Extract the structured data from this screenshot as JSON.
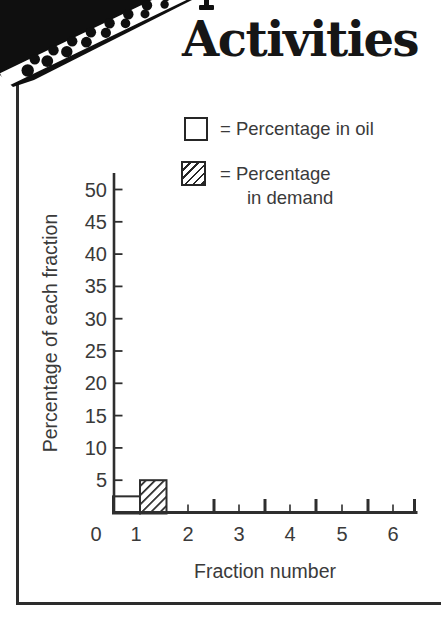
{
  "header": {
    "title": "Activities"
  },
  "legend": {
    "oil_label": "= Percentage in oil",
    "demand_line1": "= Percentage",
    "demand_line2": "in demand"
  },
  "chart_data": {
    "type": "bar",
    "title": "",
    "xlabel": "Fraction number",
    "ylabel": "Percentage of each fraction",
    "categories": [
      "0",
      "1",
      "2",
      "3",
      "4",
      "5",
      "6"
    ],
    "y_ticks": [
      5,
      10,
      15,
      20,
      25,
      30,
      35,
      40,
      45,
      50
    ],
    "ylim": [
      0,
      52
    ],
    "grid": false,
    "legend_position": "top-right",
    "series": [
      {
        "name": "Percentage in oil",
        "style": "open",
        "points": [
          {
            "x": 1,
            "value": 2.5
          }
        ]
      },
      {
        "name": "Percentage in demand",
        "style": "hatched",
        "points": [
          {
            "x": 1,
            "value": 5
          }
        ]
      }
    ],
    "ink_color": "#2e2e2e",
    "text_color": "#3a3a3a"
  }
}
